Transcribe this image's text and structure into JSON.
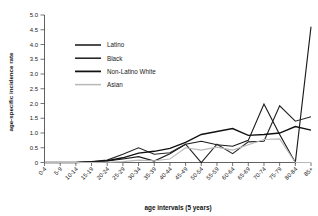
{
  "chart_data": {
    "type": "line",
    "title": "",
    "xlabel": "age intervals (5 years)",
    "ylabel": "age-specific incidence rate",
    "categories": [
      "0-4",
      "5-9",
      "10-14",
      "15-19",
      "20-24",
      "25-29",
      "30-34",
      "35-39",
      "40-44",
      "45-49",
      "50-54",
      "55-59",
      "60-64",
      "65-69",
      "70-74",
      "75-79",
      "80-84",
      "85+"
    ],
    "ylim": [
      0,
      5.0
    ],
    "yticks": [
      "0",
      "0.5",
      "1.0",
      "1.5",
      "2.0",
      "2.5",
      "3.0",
      "3.5",
      "4.0",
      "4.5",
      "5.0"
    ],
    "ytick_values": [
      0,
      0.5,
      1.0,
      1.5,
      2.0,
      2.5,
      3.0,
      3.5,
      4.0,
      4.5,
      5.0
    ],
    "grid": false,
    "legend_position": "upper-left-inside",
    "series": [
      {
        "name": "Latino",
        "color": "#1a1a1a",
        "width": 1.15,
        "values": [
          0,
          0,
          0,
          0.02,
          0.05,
          0.12,
          0.2,
          0.05,
          0.3,
          0.62,
          0.72,
          0.6,
          0.55,
          0.75,
          1.98,
          0.95,
          0.0,
          4.6
        ]
      },
      {
        "name": "Black",
        "color": "#262626",
        "width": 1.15,
        "values": [
          0,
          0,
          0,
          0.03,
          0.08,
          0.28,
          0.5,
          0.28,
          0.33,
          0.62,
          0.0,
          0.62,
          0.3,
          0.7,
          0.72,
          1.92,
          1.4,
          1.55
        ]
      },
      {
        "name": "Non-Latino White",
        "color": "#111111",
        "width": 1.35,
        "values": [
          0,
          0,
          0,
          0.02,
          0.06,
          0.16,
          0.32,
          0.38,
          0.48,
          0.68,
          0.95,
          1.05,
          1.15,
          0.92,
          0.95,
          1.0,
          1.22,
          1.1
        ]
      },
      {
        "name": "Asian",
        "color": "#b8b8b8",
        "width": 1.1,
        "values": [
          0,
          0,
          0,
          0,
          0.01,
          0.03,
          0.08,
          0.06,
          0.12,
          0.5,
          0.42,
          0.52,
          0.42,
          0.6,
          0.78,
          0.8,
          0.0,
          0.0
        ]
      }
    ]
  },
  "legend": {
    "items": [
      {
        "label": "Latino"
      },
      {
        "label": "Black"
      },
      {
        "label": "Non-Latino White"
      },
      {
        "label": "Asian"
      }
    ]
  }
}
